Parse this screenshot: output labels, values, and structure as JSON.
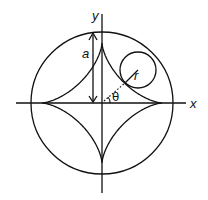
{
  "diagram": {
    "labels": {
      "y_axis": "y",
      "x_axis": "x",
      "radius_big": "a",
      "radius_small": "r",
      "angle": "θ"
    },
    "colors": {
      "stroke": "#111111",
      "background": "#ffffff"
    }
  }
}
